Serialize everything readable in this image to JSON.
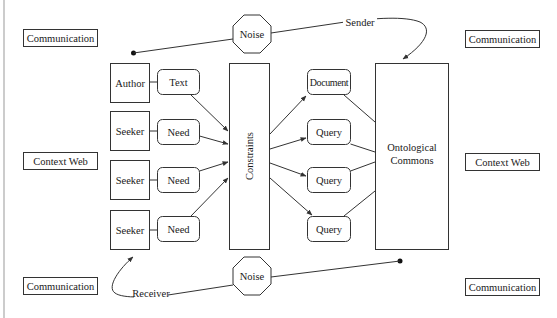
{
  "diagram": {
    "context_labels": {
      "top_left": "Communication",
      "middle_left": "Context Web",
      "bottom_left": "Communication",
      "top_right": "Communication",
      "middle_right": "Context Web",
      "bottom_right": "Communication"
    },
    "noise": {
      "top": "Noise",
      "bottom": "Noise"
    },
    "flow_labels": {
      "sender": "Sender",
      "receiver": "Receiver"
    },
    "actors": [
      {
        "label": "Author",
        "artifact": "Text"
      },
      {
        "label": "Seeker",
        "artifact": "Need"
      },
      {
        "label": "Seeker",
        "artifact": "Need"
      },
      {
        "label": "Seeker",
        "artifact": "Need"
      }
    ],
    "center_box": "Constraints",
    "outputs": [
      "Document",
      "Query",
      "Query",
      "Query"
    ],
    "commons": {
      "line1": "Ontological",
      "line2": "Commons"
    },
    "colors": {
      "stroke": "#333333",
      "text": "#1a1a1a",
      "background": "#ffffff",
      "edge_rule": "#bbbbbb"
    }
  }
}
